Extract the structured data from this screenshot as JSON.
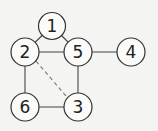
{
  "diagram": {
    "type": "graph",
    "nodes": [
      {
        "id": "1",
        "label": "1",
        "x": 52,
        "y": 26
      },
      {
        "id": "2",
        "label": "2",
        "x": 25,
        "y": 52
      },
      {
        "id": "5",
        "label": "5",
        "x": 78,
        "y": 52
      },
      {
        "id": "4",
        "label": "4",
        "x": 131,
        "y": 52
      },
      {
        "id": "6",
        "label": "6",
        "x": 25,
        "y": 107
      },
      {
        "id": "3",
        "label": "3",
        "x": 78,
        "y": 107
      }
    ],
    "edges": [
      {
        "from": "1",
        "to": "2",
        "style": "solid"
      },
      {
        "from": "1",
        "to": "5",
        "style": "solid"
      },
      {
        "from": "2",
        "to": "5",
        "style": "solid"
      },
      {
        "from": "5",
        "to": "4",
        "style": "solid"
      },
      {
        "from": "2",
        "to": "6",
        "style": "solid"
      },
      {
        "from": "5",
        "to": "3",
        "style": "solid"
      },
      {
        "from": "6",
        "to": "3",
        "style": "solid"
      },
      {
        "from": "2",
        "to": "3",
        "style": "dashed"
      }
    ]
  }
}
